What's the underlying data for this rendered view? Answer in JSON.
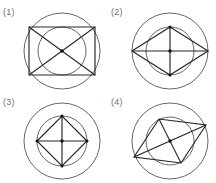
{
  "page": {
    "width": 216,
    "height": 183,
    "background": "#ffffff",
    "top_clipped_text": "        ",
    "stroke_color_outline": "#555555",
    "stroke_color_shape": "#262626",
    "label_color": "#6f6f6f"
  },
  "chart_data": {
    "type": "diagram",
    "title": "",
    "layout": "2x2 grid of labeled geometric constructions",
    "panels": [
      {
        "label": "(1)",
        "shape": "rectangle",
        "description": "Wide rectangle inscribed in outer circle, both diagonals drawn, inner concentric circle, centre dot",
        "outer_circle": {
          "cx": 45,
          "cy": 46,
          "r": 38
        },
        "inner_circle": {
          "cx": 45,
          "cy": 46,
          "r": 24
        },
        "polygon_points": "12,22 78,22 78,70 12,70",
        "diagonals": [
          {
            "x1": 12,
            "y1": 22,
            "x2": 78,
            "y2": 70
          },
          {
            "x1": 78,
            "y1": 22,
            "x2": 12,
            "y2": 70
          }
        ],
        "centre_dot": {
          "cx": 45,
          "cy": 46,
          "r": 1.7
        },
        "vertex_dots": []
      },
      {
        "label": "(2)",
        "shape": "rhombus-wide",
        "description": "Horizontally elongated rhombus; left and right vertices on outer circle, top and bottom vertices on inner circle; horizontal and vertical diagonals drawn",
        "outer_circle": {
          "cx": 45,
          "cy": 46,
          "r": 38
        },
        "inner_circle": {
          "cx": 45,
          "cy": 46,
          "r": 24
        },
        "polygon_points": "7,46 45,22 83,46 45,70",
        "diagonals": [
          {
            "x1": 7,
            "y1": 46,
            "x2": 83,
            "y2": 46
          },
          {
            "x1": 45,
            "y1": 22,
            "x2": 45,
            "y2": 70
          }
        ],
        "centre_dot": {
          "cx": 45,
          "cy": 46,
          "r": 1.7
        },
        "vertex_dots": [
          {
            "cx": 45,
            "cy": 22,
            "r": 1.5
          },
          {
            "cx": 45,
            "cy": 70,
            "r": 1.5
          }
        ]
      },
      {
        "label": "(3)",
        "shape": "square-rotated",
        "description": "Small regular diamond (square rotated 45 degrees) inscribed in the inner circle, both diagonals drawn, larger outer concentric circle, centre dot",
        "outer_circle": {
          "cx": 45,
          "cy": 46,
          "r": 38
        },
        "inner_circle": {
          "cx": 45,
          "cy": 46,
          "r": 25
        },
        "polygon_points": "20,46 45,21 70,46 45,71",
        "diagonals": [
          {
            "x1": 20,
            "y1": 46,
            "x2": 70,
            "y2": 46
          },
          {
            "x1": 45,
            "y1": 21,
            "x2": 45,
            "y2": 71
          }
        ],
        "centre_dot": {
          "cx": 45,
          "cy": 46,
          "r": 1.7
        },
        "vertex_dots": [
          {
            "cx": 45,
            "cy": 21,
            "r": 1.5
          },
          {
            "cx": 45,
            "cy": 71,
            "r": 1.5
          },
          {
            "cx": 20,
            "cy": 46,
            "r": 1.5
          },
          {
            "cx": 70,
            "cy": 46,
            "r": 1.5
          }
        ]
      },
      {
        "label": "(4)",
        "shape": "quadrilateral-tilted",
        "description": "Skewed quadrilateral rotated roughly 20 degrees with vertices near the outer circle, both diagonals drawn, inner concentric circle, centre dot",
        "outer_circle": {
          "cx": 45,
          "cy": 46,
          "r": 38
        },
        "inner_circle": {
          "cx": 45,
          "cy": 46,
          "r": 24
        },
        "polygon_points": "9,62 34,24 81,30 56,68",
        "diagonals": [
          {
            "x1": 9,
            "y1": 62,
            "x2": 81,
            "y2": 30
          },
          {
            "x1": 34,
            "y1": 24,
            "x2": 56,
            "y2": 68
          }
        ],
        "centre_dot": {
          "cx": 45,
          "cy": 46,
          "r": 1.7
        },
        "vertex_dots": []
      }
    ]
  }
}
